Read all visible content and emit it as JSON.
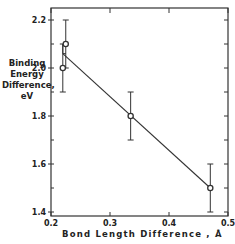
{
  "chart_data": {
    "type": "scatter",
    "title": "",
    "xlabel": "Bond Length Difference , Å",
    "ylabel_lines": [
      "Binding",
      "Energy",
      "Difference,",
      "eV"
    ],
    "xlim": [
      0.2,
      0.5
    ],
    "ylim": [
      1.4,
      2.25
    ],
    "x_ticks": [
      0.2,
      0.3,
      0.4,
      0.5
    ],
    "x_tick_labels": [
      "0.2",
      "0.3",
      "0.4",
      "0.5"
    ],
    "y_ticks": [
      1.4,
      1.6,
      1.8,
      2.0,
      2.2
    ],
    "y_tick_labels": [
      "1.4",
      "1.6",
      "1.8",
      "2.0",
      "2.2"
    ],
    "y_minor_ticks": [
      1.5,
      1.7,
      1.9,
      2.1
    ],
    "grid": false,
    "legend": null,
    "series": [
      {
        "name": "data",
        "points": [
          {
            "x": 0.22,
            "y": 2.0,
            "err_low": 1.9,
            "err_high": 2.1
          },
          {
            "x": 0.225,
            "y": 2.1,
            "err_low": 2.0,
            "err_high": 2.2
          },
          {
            "x": 0.335,
            "y": 1.8,
            "err_low": 1.7,
            "err_high": 1.9
          },
          {
            "x": 0.47,
            "y": 1.5,
            "err_low": 1.4,
            "err_high": 1.6
          }
        ]
      }
    ],
    "fit_line": {
      "x": [
        0.22,
        0.47
      ],
      "y": [
        2.06,
        1.5
      ]
    },
    "bracket": {
      "x": 0.22,
      "y_low": 2.06,
      "y_high": 2.1
    }
  }
}
